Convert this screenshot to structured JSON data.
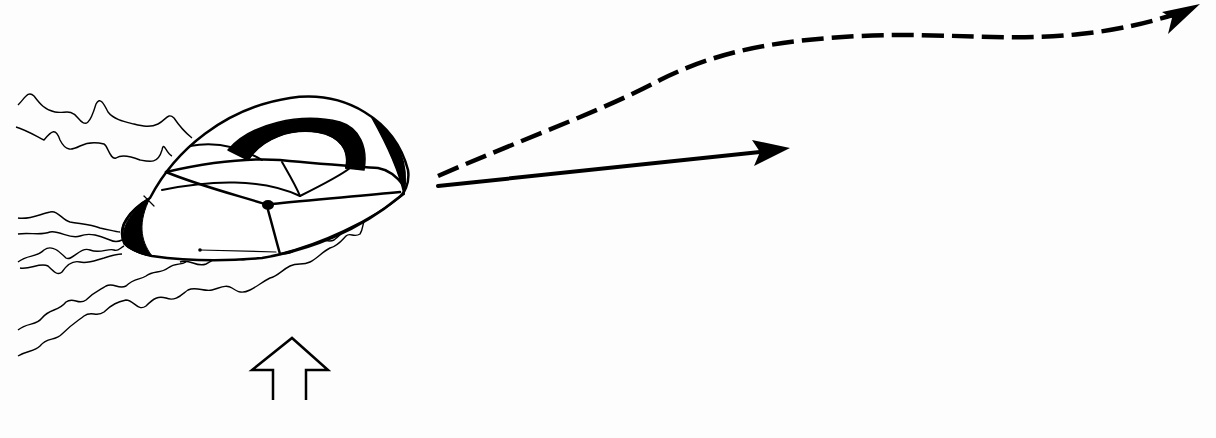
{
  "diagram": {
    "type": "line-drawing",
    "elements": {
      "object": "canopy-body",
      "wake": "turbulent-wake-lines",
      "solid_arrow": "straight-trajectory-arrow",
      "dashed_arrow": "curved-dashed-trajectory-arrow",
      "hollow_arrow": "upward-flow-arrow"
    },
    "colors": {
      "ink": "#000000",
      "background": "#fdfdfd"
    }
  }
}
